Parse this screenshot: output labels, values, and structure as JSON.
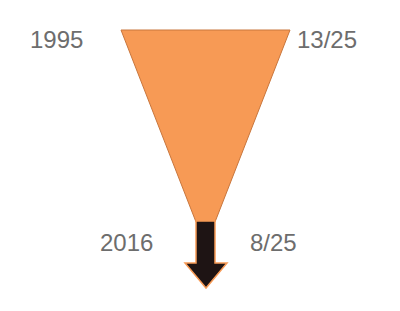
{
  "diagram": {
    "type": "funnel-with-arrow",
    "top": {
      "year": "1995",
      "value": "13/25"
    },
    "bottom": {
      "year": "2016",
      "value": "8/25"
    },
    "colors": {
      "funnel": "#f79a55",
      "funnel_edge": "#c9763c",
      "arrow": "#1e1414",
      "arrow_glow": "#f79a55",
      "text": "#6d6d6d"
    },
    "icons": [
      "down-arrow-icon"
    ]
  }
}
